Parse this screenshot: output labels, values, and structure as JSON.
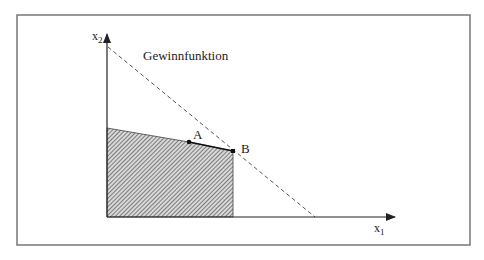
{
  "diagram": {
    "type": "linear-programming-feasible-region",
    "title_label": "Gewinnfunktion",
    "axes": {
      "x_label": "x",
      "x_subscript": "1",
      "y_label": "x",
      "y_subscript": "2"
    },
    "points": [
      {
        "label": "A",
        "x": 189,
        "y": 142
      },
      {
        "label": "B",
        "x": 233,
        "y": 151
      }
    ],
    "feasible_region": {
      "fill": "hatched",
      "vertices": [
        [
          107,
          128
        ],
        [
          189,
          142
        ],
        [
          233,
          151
        ],
        [
          233,
          217
        ],
        [
          107,
          217
        ]
      ]
    },
    "profit_line": {
      "style": "dashed",
      "from": [
        108,
        47
      ],
      "to": [
        315,
        217
      ]
    },
    "colors": {
      "line": "#222222",
      "frame": "#777777",
      "hatch": "#555555",
      "dashed": "#555555"
    }
  }
}
